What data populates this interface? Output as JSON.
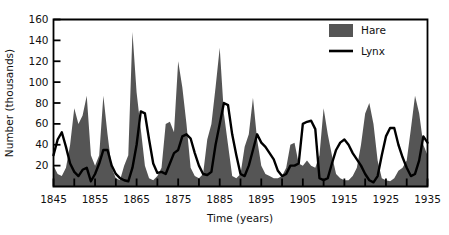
{
  "chart_data": {
    "type": "area",
    "title": "",
    "xlabel": "Time (years)",
    "ylabel": "Number (thousands)",
    "xlim": [
      1845,
      1935
    ],
    "ylim": [
      0,
      160
    ],
    "xticks": [
      1845,
      1855,
      1865,
      1875,
      1885,
      1895,
      1905,
      1915,
      1925,
      1935
    ],
    "xtick_labels": [
      "1845",
      "1855",
      "1865",
      "1875",
      "1885",
      "1895",
      "1905",
      "1915",
      "1925",
      "1935"
    ],
    "xminor_step": 5,
    "yticks": [
      20,
      40,
      60,
      80,
      100,
      120,
      140,
      160
    ],
    "ytick_labels": [
      "20",
      "40",
      "60",
      "80",
      "100",
      "120",
      "140",
      "160"
    ],
    "grid": false,
    "legend_position": "top-right",
    "colors": {
      "hare_fill": "#555555",
      "lynx_line": "#000000",
      "axis": "#000000",
      "background": "#ffffff"
    },
    "legend": [
      {
        "name": "Hare",
        "marker": "filled-square",
        "color": "#555555"
      },
      {
        "name": "Lynx",
        "marker": "line",
        "color": "#000000"
      }
    ],
    "x": [
      1845,
      1846,
      1847,
      1848,
      1849,
      1850,
      1851,
      1852,
      1853,
      1854,
      1855,
      1856,
      1857,
      1858,
      1859,
      1860,
      1861,
      1862,
      1863,
      1864,
      1865,
      1866,
      1867,
      1868,
      1869,
      1870,
      1871,
      1872,
      1873,
      1874,
      1875,
      1876,
      1877,
      1878,
      1879,
      1880,
      1881,
      1882,
      1883,
      1884,
      1885,
      1886,
      1887,
      1888,
      1889,
      1890,
      1891,
      1892,
      1893,
      1894,
      1895,
      1896,
      1897,
      1898,
      1899,
      1900,
      1901,
      1902,
      1903,
      1904,
      1905,
      1906,
      1907,
      1908,
      1909,
      1910,
      1911,
      1912,
      1913,
      1914,
      1915,
      1916,
      1917,
      1918,
      1919,
      1920,
      1921,
      1922,
      1923,
      1924,
      1925,
      1926,
      1927,
      1928,
      1929,
      1930,
      1931,
      1932,
      1933,
      1934,
      1935
    ],
    "series": [
      {
        "name": "Hare",
        "kind": "area",
        "color": "#555555",
        "values": [
          20,
          12,
          10,
          18,
          40,
          75,
          60,
          68,
          87,
          30,
          20,
          30,
          87,
          50,
          18,
          8,
          6,
          20,
          30,
          148,
          90,
          55,
          20,
          8,
          6,
          10,
          18,
          60,
          62,
          52,
          120,
          95,
          60,
          18,
          10,
          8,
          12,
          45,
          60,
          95,
          133,
          70,
          40,
          10,
          8,
          12,
          38,
          50,
          85,
          45,
          20,
          12,
          10,
          8,
          8,
          10,
          18,
          40,
          42,
          22,
          20,
          25,
          20,
          18,
          30,
          75,
          50,
          30,
          12,
          8,
          6,
          6,
          10,
          18,
          40,
          70,
          80,
          60,
          25,
          8,
          6,
          5,
          8,
          15,
          18,
          25,
          55,
          87,
          70,
          40,
          30
        ]
      },
      {
        "name": "Lynx",
        "kind": "line",
        "color": "#000000",
        "values": [
          30,
          45,
          52,
          38,
          22,
          14,
          10,
          16,
          18,
          5,
          12,
          22,
          35,
          35,
          20,
          12,
          8,
          6,
          5,
          18,
          40,
          72,
          70,
          45,
          22,
          13,
          14,
          12,
          22,
          32,
          35,
          48,
          50,
          46,
          32,
          20,
          12,
          11,
          14,
          40,
          60,
          80,
          78,
          50,
          30,
          12,
          10,
          20,
          35,
          50,
          42,
          38,
          32,
          26,
          15,
          10,
          12,
          20,
          20,
          22,
          60,
          62,
          63,
          55,
          8,
          6,
          8,
          22,
          35,
          42,
          45,
          40,
          32,
          26,
          20,
          12,
          6,
          4,
          10,
          30,
          48,
          56,
          56,
          40,
          28,
          18,
          10,
          12,
          25,
          48,
          42
        ]
      }
    ]
  }
}
